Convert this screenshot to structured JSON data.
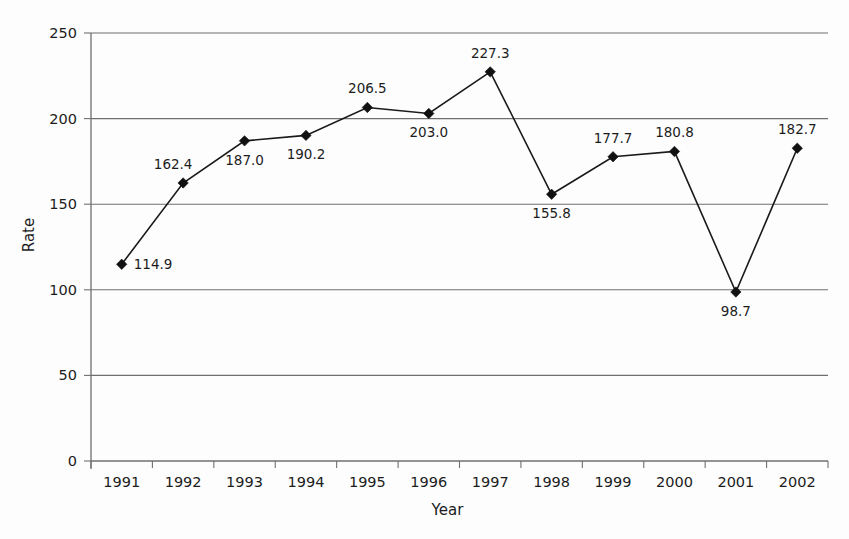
{
  "chart_data": {
    "type": "line",
    "title": "",
    "subtitle": "",
    "xlabel": "Year",
    "ylabel": "Rate",
    "categories": [
      "1991",
      "1992",
      "1993",
      "1994",
      "1995",
      "1996",
      "1997",
      "1998",
      "1999",
      "2000",
      "2001",
      "2002"
    ],
    "values": [
      114.9,
      162.4,
      187.0,
      190.2,
      206.5,
      203.0,
      227.3,
      155.8,
      177.7,
      180.8,
      98.7,
      182.7
    ],
    "point_labels": [
      "114.9",
      "162.4",
      "187.0",
      "190.2",
      "206.5",
      "203.0",
      "227.3",
      "155.8",
      "177.7",
      "180.8",
      "98.7",
      "182.7"
    ],
    "label_positions": [
      "right",
      "above-left",
      "below",
      "below",
      "above",
      "below",
      "above",
      "below",
      "above",
      "above",
      "below",
      "above"
    ],
    "ylim": [
      0,
      250
    ],
    "yticks": [
      0,
      50,
      100,
      150,
      200,
      250
    ],
    "ytick_labels": [
      "0",
      "50",
      "100",
      "150",
      "200",
      "250"
    ],
    "grid": true,
    "grid_axis": "y",
    "legend": "none",
    "marker": "diamond",
    "series_color": "#111111",
    "grid_color": "#6f6f6f",
    "background_color": "#fdfdfd"
  }
}
